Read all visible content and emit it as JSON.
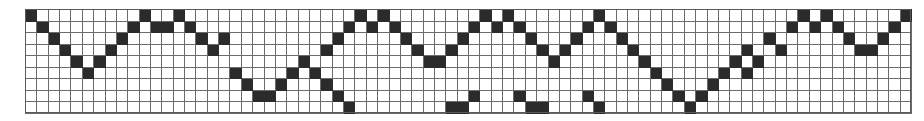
{
  "figure": {
    "kind": "grid-pattern",
    "columns": 78,
    "rows": 9,
    "cell_width_px": 11.36,
    "cell_height_px": 11.56,
    "origin_x_px": 25,
    "origin_y_px": 9,
    "colors": {
      "filled": "#2b2b2b",
      "empty": "#ffffff",
      "gridline": "#6b6b6b",
      "background": "#ffffff",
      "frame": "#5a5a5a"
    }
  },
  "chart_data": {
    "type": "heatmap",
    "title": "",
    "xlabel": "",
    "ylabel": "",
    "grid": true,
    "legend": "none",
    "ncols": 78,
    "nrows": 9,
    "value_labels": {
      "0": "empty",
      "1": "filled"
    },
    "matrix": [
      [
        1,
        0,
        0,
        0,
        0,
        0,
        0,
        0,
        0,
        0,
        1,
        0,
        0,
        1,
        0,
        0,
        0,
        0,
        0,
        0,
        0,
        0,
        0,
        0,
        0,
        0,
        0,
        0,
        0,
        1,
        0,
        1,
        0,
        0,
        0,
        0,
        0,
        0,
        0,
        0,
        1,
        0,
        1,
        0,
        0,
        0,
        0,
        0,
        0,
        0,
        1,
        0,
        0,
        0,
        0,
        0,
        0,
        0,
        0,
        0,
        0,
        0,
        0,
        0,
        0,
        0,
        0,
        0,
        1,
        0,
        1,
        0,
        0,
        0,
        0,
        0,
        0,
        1
      ],
      [
        0,
        1,
        0,
        0,
        0,
        0,
        0,
        0,
        0,
        1,
        0,
        1,
        1,
        0,
        1,
        0,
        0,
        0,
        0,
        0,
        0,
        0,
        0,
        0,
        0,
        0,
        0,
        0,
        1,
        0,
        1,
        0,
        1,
        0,
        0,
        0,
        0,
        0,
        0,
        1,
        0,
        1,
        0,
        1,
        0,
        0,
        0,
        0,
        0,
        1,
        0,
        1,
        0,
        0,
        0,
        0,
        0,
        0,
        0,
        0,
        0,
        0,
        0,
        0,
        0,
        0,
        0,
        1,
        0,
        1,
        0,
        1,
        0,
        0,
        0,
        0,
        1,
        0
      ],
      [
        0,
        0,
        1,
        0,
        0,
        0,
        0,
        0,
        1,
        0,
        0,
        0,
        0,
        0,
        0,
        1,
        0,
        1,
        0,
        0,
        0,
        0,
        0,
        0,
        0,
        0,
        0,
        1,
        0,
        0,
        0,
        0,
        0,
        1,
        0,
        0,
        0,
        0,
        1,
        0,
        0,
        0,
        0,
        0,
        1,
        0,
        0,
        0,
        1,
        0,
        0,
        0,
        1,
        0,
        0,
        0,
        0,
        0,
        0,
        0,
        0,
        0,
        0,
        0,
        0,
        1,
        0,
        0,
        0,
        0,
        0,
        0,
        1,
        0,
        0,
        1,
        0,
        0
      ],
      [
        0,
        0,
        0,
        1,
        0,
        0,
        0,
        1,
        0,
        0,
        0,
        0,
        0,
        0,
        0,
        0,
        1,
        0,
        0,
        0,
        0,
        0,
        0,
        0,
        0,
        0,
        1,
        0,
        0,
        0,
        0,
        0,
        0,
        0,
        1,
        0,
        0,
        1,
        0,
        0,
        0,
        0,
        0,
        0,
        0,
        1,
        0,
        1,
        0,
        0,
        0,
        0,
        0,
        1,
        0,
        0,
        0,
        0,
        0,
        0,
        0,
        0,
        0,
        1,
        0,
        0,
        1,
        0,
        0,
        0,
        0,
        0,
        0,
        1,
        1,
        0,
        0,
        0
      ],
      [
        0,
        0,
        0,
        0,
        1,
        0,
        1,
        0,
        0,
        0,
        0,
        0,
        0,
        0,
        0,
        0,
        0,
        0,
        0,
        0,
        0,
        0,
        0,
        0,
        1,
        0,
        0,
        0,
        0,
        0,
        0,
        0,
        0,
        0,
        0,
        1,
        1,
        0,
        0,
        0,
        0,
        0,
        0,
        0,
        0,
        0,
        1,
        0,
        0,
        0,
        0,
        0,
        0,
        0,
        1,
        0,
        0,
        0,
        0,
        0,
        0,
        0,
        1,
        0,
        1,
        0,
        0,
        0,
        0,
        0,
        0,
        0,
        0,
        0,
        0,
        0,
        0,
        0
      ],
      [
        0,
        0,
        0,
        0,
        0,
        1,
        0,
        0,
        0,
        0,
        0,
        0,
        0,
        0,
        0,
        0,
        0,
        0,
        1,
        0,
        0,
        0,
        0,
        1,
        0,
        1,
        0,
        0,
        0,
        0,
        0,
        0,
        0,
        0,
        0,
        0,
        0,
        0,
        0,
        0,
        0,
        0,
        0,
        0,
        0,
        0,
        0,
        0,
        0,
        0,
        0,
        0,
        0,
        0,
        0,
        1,
        0,
        0,
        0,
        0,
        0,
        1,
        0,
        1,
        0,
        0,
        0,
        0,
        0,
        0,
        0,
        0,
        0,
        0,
        0,
        0,
        0,
        0
      ],
      [
        0,
        0,
        0,
        0,
        0,
        0,
        0,
        0,
        0,
        0,
        0,
        0,
        0,
        0,
        0,
        0,
        0,
        0,
        0,
        1,
        0,
        0,
        1,
        0,
        0,
        0,
        1,
        0,
        0,
        0,
        0,
        0,
        0,
        0,
        0,
        0,
        0,
        0,
        0,
        0,
        0,
        0,
        0,
        0,
        0,
        0,
        0,
        0,
        0,
        0,
        0,
        0,
        0,
        0,
        0,
        0,
        1,
        0,
        0,
        0,
        1,
        0,
        0,
        0,
        0,
        0,
        0,
        0,
        0,
        0,
        0,
        0,
        0,
        0,
        0,
        0,
        0,
        0
      ],
      [
        0,
        0,
        0,
        0,
        0,
        0,
        0,
        0,
        0,
        0,
        0,
        0,
        0,
        0,
        0,
        0,
        0,
        0,
        0,
        0,
        1,
        1,
        0,
        0,
        0,
        0,
        0,
        1,
        0,
        0,
        0,
        0,
        0,
        0,
        0,
        0,
        0,
        0,
        0,
        1,
        0,
        0,
        0,
        1,
        0,
        0,
        0,
        0,
        0,
        1,
        0,
        0,
        0,
        0,
        0,
        0,
        0,
        1,
        0,
        1,
        0,
        0,
        0,
        0,
        0,
        0,
        0,
        0,
        0,
        0,
        0,
        0,
        0,
        0,
        0,
        0,
        0,
        0
      ],
      [
        0,
        0,
        0,
        0,
        0,
        0,
        0,
        0,
        0,
        0,
        0,
        0,
        0,
        0,
        0,
        0,
        0,
        0,
        0,
        0,
        0,
        0,
        0,
        0,
        0,
        0,
        0,
        0,
        1,
        0,
        0,
        0,
        0,
        0,
        0,
        0,
        0,
        1,
        1,
        0,
        0,
        0,
        0,
        0,
        1,
        1,
        0,
        0,
        0,
        0,
        1,
        0,
        0,
        0,
        0,
        0,
        0,
        0,
        1,
        0,
        0,
        0,
        0,
        0,
        0,
        0,
        0,
        0,
        0,
        0,
        0,
        0,
        0,
        0,
        0,
        0,
        0,
        0
      ]
    ]
  }
}
